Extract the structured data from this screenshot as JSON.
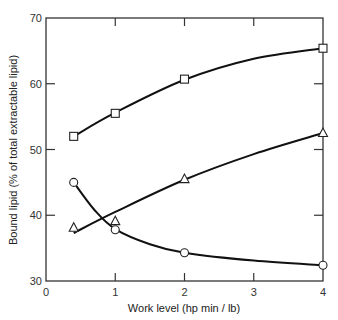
{
  "chart_data": {
    "type": "line",
    "title": "",
    "xlabel": "Work level (hp min / lb)",
    "ylabel": "Bound lipid (% of total extractable lipid)",
    "xlim": [
      0,
      4
    ],
    "ylim": [
      30,
      70
    ],
    "xticks": [
      0,
      1,
      2,
      3,
      4
    ],
    "yticks": [
      30,
      40,
      50,
      60,
      70
    ],
    "grid": false,
    "legend": null,
    "x": [
      0.4,
      1,
      2,
      4
    ],
    "series": [
      {
        "name": "square",
        "marker": "square",
        "values": [
          52,
          55.5,
          60.7,
          65.4
        ],
        "curve": [
          [
            0.4,
            52
          ],
          [
            1,
            55.6
          ],
          [
            2,
            60.6
          ],
          [
            3,
            63.8
          ],
          [
            4,
            65.4
          ]
        ]
      },
      {
        "name": "triangle",
        "marker": "triangle",
        "values": [
          38.1,
          39.1,
          45.5,
          52.5
        ],
        "curve": [
          [
            0.4,
            37.3
          ],
          [
            1,
            40.5
          ],
          [
            2,
            45.4
          ],
          [
            3,
            49.3
          ],
          [
            4,
            52.5
          ]
        ]
      },
      {
        "name": "circle",
        "marker": "circle",
        "values": [
          45,
          37.8,
          34.3,
          32.4
        ],
        "curve": [
          [
            0.4,
            45
          ],
          [
            0.7,
            40.8
          ],
          [
            1,
            37.9
          ],
          [
            1.5,
            35.6
          ],
          [
            2,
            34.3
          ],
          [
            3,
            33.1
          ],
          [
            4,
            32.4
          ]
        ]
      }
    ]
  }
}
